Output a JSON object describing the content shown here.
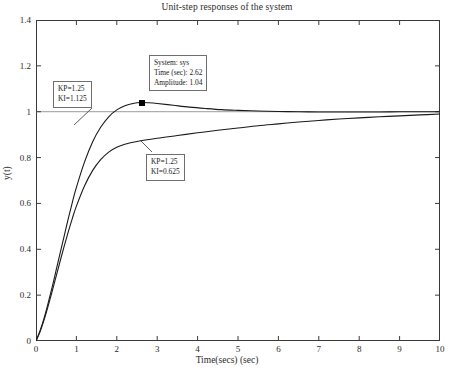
{
  "chart_data": {
    "type": "line",
    "title": "Unit-step responses of the system",
    "xlabel": "Time(secs) (sec)",
    "ylabel": "y(t)",
    "xlim": [
      0,
      10
    ],
    "ylim": [
      0,
      1.4
    ],
    "xticks": [
      "0",
      "1",
      "2",
      "3",
      "4",
      "5",
      "6",
      "7",
      "8",
      "9",
      "10"
    ],
    "yticks": [
      "0",
      "0.2",
      "0.4",
      "0.6",
      "0.8",
      "1",
      "1.2",
      "1.4"
    ],
    "grid": false,
    "legend": "none",
    "reference_line": {
      "y": 1,
      "label": "steady-state reference"
    },
    "series": [
      {
        "name": "KP=1.25, KI=1.125",
        "color": "#1a1a1a",
        "x": [
          0,
          0.1,
          0.2,
          0.3,
          0.4,
          0.5,
          0.6,
          0.7,
          0.8,
          0.9,
          1.0,
          1.2,
          1.4,
          1.6,
          1.8,
          2.0,
          2.2,
          2.4,
          2.62,
          2.8,
          3.0,
          3.4,
          3.8,
          4.2,
          4.6,
          5.0,
          5.5,
          6.0,
          6.5,
          7.0,
          7.5,
          8.0,
          8.5,
          9.0,
          9.5,
          10.0
        ],
        "y": [
          0,
          0.045,
          0.1,
          0.165,
          0.235,
          0.31,
          0.385,
          0.46,
          0.535,
          0.605,
          0.67,
          0.78,
          0.868,
          0.932,
          0.978,
          1.008,
          1.026,
          1.036,
          1.04,
          1.039,
          1.036,
          1.028,
          1.02,
          1.014,
          1.009,
          1.006,
          1.003,
          1.001,
          1.0,
          0.999,
          0.999,
          0.999,
          0.999,
          1.0,
          1.0,
          1.0
        ]
      },
      {
        "name": "KP=1.25, KI=0.625",
        "color": "#1a1a1a",
        "x": [
          0,
          0.1,
          0.2,
          0.3,
          0.4,
          0.5,
          0.6,
          0.7,
          0.8,
          0.9,
          1.0,
          1.2,
          1.4,
          1.6,
          1.8,
          2.0,
          2.2,
          2.5,
          3.0,
          3.5,
          4.0,
          4.5,
          5.0,
          5.5,
          6.0,
          6.5,
          7.0,
          7.5,
          8.0,
          8.5,
          9.0,
          9.5,
          10.0
        ],
        "y": [
          0,
          0.04,
          0.092,
          0.152,
          0.216,
          0.283,
          0.35,
          0.415,
          0.477,
          0.535,
          0.588,
          0.676,
          0.743,
          0.791,
          0.824,
          0.845,
          0.858,
          0.87,
          0.884,
          0.896,
          0.908,
          0.919,
          0.929,
          0.939,
          0.947,
          0.955,
          0.962,
          0.968,
          0.973,
          0.978,
          0.982,
          0.986,
          0.99
        ]
      }
    ],
    "datatip": {
      "system_label": "System: sys",
      "time_label": "Time (sec): 2.62",
      "amplitude_label": "Amplitude: 1.04",
      "time": 2.62,
      "amplitude": 1.04
    },
    "annotations": [
      {
        "id": "fast-gains",
        "line1": "KP=1.25",
        "line2": "KI=1.125"
      },
      {
        "id": "slow-gains",
        "line1": "KP=1.25",
        "line2": "KI=0.625"
      }
    ]
  }
}
